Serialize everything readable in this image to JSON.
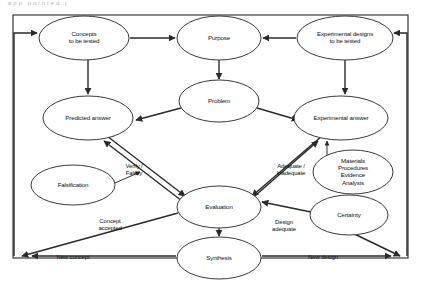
{
  "diagram": {
    "title_fragment": "app pointed  j",
    "frame": {
      "color": "#3a3a3a"
    },
    "nodes": [
      {
        "id": "concepts",
        "lines": [
          "Concepts",
          "to be tested"
        ],
        "cx": 84,
        "cy": 38,
        "rx": 45,
        "ry": 22
      },
      {
        "id": "purpose",
        "lines": [
          "Purpose"
        ],
        "cx": 219,
        "cy": 38,
        "rx": 42,
        "ry": 22
      },
      {
        "id": "expdesigns",
        "lines": [
          "Experimental designs",
          "to be tested"
        ],
        "cx": 345,
        "cy": 38,
        "rx": 48,
        "ry": 22
      },
      {
        "id": "problem",
        "lines": [
          "Problem"
        ],
        "cx": 219,
        "cy": 101,
        "rx": 40,
        "ry": 21
      },
      {
        "id": "predicted",
        "lines": [
          "Predicted answer"
        ],
        "cx": 88,
        "cy": 118,
        "rx": 45,
        "ry": 22
      },
      {
        "id": "expanswer",
        "lines": [
          "Experimental answer"
        ],
        "cx": 341,
        "cy": 118,
        "rx": 47,
        "ry": 22
      },
      {
        "id": "materials",
        "lines": [
          "Materials",
          "Procedures",
          "Evidence",
          "Analysis"
        ],
        "cx": 353,
        "cy": 172,
        "rx": 40,
        "ry": 22
      },
      {
        "id": "falsification",
        "lines": [
          "Falsification"
        ],
        "cx": 73,
        "cy": 185,
        "rx": 42,
        "ry": 20
      },
      {
        "id": "evaluation",
        "lines": [
          "Evaluation"
        ],
        "cx": 219,
        "cy": 207,
        "rx": 42,
        "ry": 21
      },
      {
        "id": "certainty",
        "lines": [
          "Certainty"
        ],
        "cx": 349,
        "cy": 215,
        "rx": 39,
        "ry": 20
      },
      {
        "id": "synthesis",
        "lines": [
          "Synthesis"
        ],
        "cx": 219,
        "cy": 258,
        "rx": 42,
        "ry": 21
      }
    ],
    "edge_labels": [
      {
        "id": "verify-falsify",
        "lines": [
          "Verify /",
          "Falsify"
        ],
        "x": 134,
        "y": 166
      },
      {
        "id": "adequate-inadequate",
        "lines": [
          "Adequate /",
          "Inadequate"
        ],
        "x": 291,
        "y": 166
      },
      {
        "id": "concept-accepted",
        "lines": [
          "Concept",
          "accepted"
        ],
        "x": 110,
        "y": 221
      },
      {
        "id": "design-adequate",
        "lines": [
          "Design",
          "adequate"
        ],
        "x": 284,
        "y": 222
      },
      {
        "id": "new-concept",
        "lines": [
          "New concept"
        ],
        "x": 73,
        "y": 257
      },
      {
        "id": "new-design",
        "lines": [
          "New design"
        ],
        "x": 323,
        "y": 257
      }
    ]
  }
}
